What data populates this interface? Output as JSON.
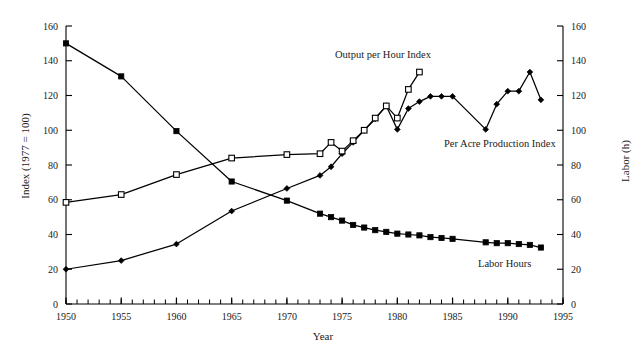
{
  "chart_data": {
    "type": "line",
    "title": "",
    "xlabel": "Year",
    "ylabel": "Index (1977 = 100)",
    "ylabel_right": "Labor (h)",
    "xlim": [
      1950,
      1995
    ],
    "ylim": [
      0,
      160
    ],
    "ylim_right": [
      0,
      160
    ],
    "grid": false,
    "legend_position": "inline-annotations",
    "x_ticks_major": [
      1950,
      1955,
      1960,
      1965,
      1970,
      1975,
      1980,
      1985,
      1990,
      1995
    ],
    "x_tick_labels": [
      "1950",
      "1955",
      "1960",
      "1965",
      "1970",
      "1975",
      "1980",
      "1985",
      "1990",
      "1995"
    ],
    "x_tick_interval_minor": 1,
    "y_ticks": [
      0,
      20,
      40,
      60,
      80,
      100,
      120,
      140,
      160
    ],
    "y_tick_labels": [
      "0",
      "20",
      "40",
      "60",
      "80",
      "100",
      "120",
      "140",
      "160"
    ],
    "y_ticks_right": [
      0,
      20,
      40,
      60,
      80,
      100,
      120,
      140,
      160
    ],
    "y_tick_labels_right": [
      "0",
      "20",
      "40",
      "60",
      "80",
      "100",
      "120",
      "140",
      "160"
    ],
    "series": [
      {
        "name": "Labor Hours",
        "marker": "filled-square",
        "axis": "right",
        "x": [
          1950,
          1955,
          1960,
          1965,
          1970,
          1973,
          1974,
          1975,
          1976,
          1977,
          1978,
          1979,
          1980,
          1981,
          1982,
          1983,
          1984,
          1985,
          1988,
          1989,
          1990,
          1991,
          1992,
          1993
        ],
        "values": [
          150,
          131,
          99.5,
          70.5,
          59.5,
          52,
          50,
          48,
          45.5,
          44,
          42.5,
          41.5,
          40.5,
          40,
          39.5,
          38.5,
          38,
          37.5,
          35.5,
          35,
          35,
          34.5,
          34,
          32.5
        ]
      },
      {
        "name": "Per Acre Production Index",
        "marker": "filled-diamond",
        "axis": "left",
        "x": [
          1950,
          1955,
          1960,
          1965,
          1970,
          1973,
          1974,
          1975,
          1976,
          1977,
          1978,
          1979,
          1980,
          1981,
          1982,
          1983,
          1984,
          1985,
          1988,
          1989,
          1990,
          1991,
          1992,
          1993
        ],
        "values": [
          20,
          25,
          34.5,
          53.5,
          66.5,
          74,
          79,
          86.5,
          93,
          100,
          106.5,
          114,
          100.5,
          112.5,
          116.5,
          119.5,
          119.5,
          119.5,
          100.5,
          115,
          122.5,
          122.5,
          133.5,
          117.5
        ]
      },
      {
        "name": "Output per Hour Index",
        "marker": "open-square",
        "axis": "left",
        "x": [
          1950,
          1955,
          1960,
          1965,
          1970,
          1973,
          1974,
          1975,
          1976,
          1977,
          1978,
          1979,
          1980,
          1981,
          1982
        ],
        "values": [
          58.5,
          63,
          74.5,
          84,
          86,
          86.5,
          93,
          88,
          94,
          100,
          107,
          114,
          107,
          123.5,
          133.5
        ]
      }
    ],
    "annotations": [
      {
        "text": "Output per Hour Index",
        "x": 1975.5,
        "y": 152
      },
      {
        "text": "Per Acre Production Index",
        "x": 1984,
        "y": 98
      },
      {
        "text": "Labor Hours",
        "x": 1987,
        "y": 34
      }
    ]
  },
  "axes": {
    "x_title": "Year",
    "y_left_title": "Index (1977 = 100)",
    "y_right_title": "Labor (h)"
  },
  "labels": {
    "output_per_hour": "Output per Hour Index",
    "per_acre": "Per Acre Production Index",
    "labor_hours": "Labor Hours"
  },
  "colors": {
    "line": "#000000",
    "text": "#1a1a1a",
    "background": "#ffffff",
    "marker_fill": "#000000",
    "marker_open_fill": "#ffffff"
  }
}
